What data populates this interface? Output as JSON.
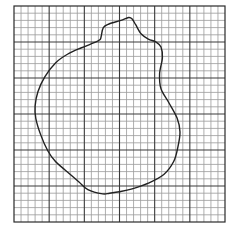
{
  "diagram": {
    "grid": {
      "columns": 30,
      "rows": 30,
      "major_every": 5,
      "minor_color": "#9a9a9a",
      "major_color": "#3a3a3a",
      "border_color": "#2a2a2a"
    },
    "outline": {
      "stroke_color": "#222222",
      "closed": true,
      "points_in_grid_units": [
        [
          12.4,
          4.2
        ],
        [
          12.7,
          3.0
        ],
        [
          13.5,
          2.5
        ],
        [
          15.2,
          2.0
        ],
        [
          16.3,
          1.6
        ],
        [
          16.8,
          1.8
        ],
        [
          17.3,
          2.6
        ],
        [
          18.1,
          3.9
        ],
        [
          19.1,
          4.6
        ],
        [
          20.2,
          5.0
        ],
        [
          20.9,
          5.7
        ],
        [
          21.1,
          7.2
        ],
        [
          20.7,
          9.4
        ],
        [
          20.9,
          11.5
        ],
        [
          22.0,
          13.4
        ],
        [
          23.2,
          15.6
        ],
        [
          23.6,
          17.5
        ],
        [
          23.3,
          19.6
        ],
        [
          22.7,
          21.6
        ],
        [
          21.3,
          23.4
        ],
        [
          19.1,
          24.6
        ],
        [
          16.8,
          25.4
        ],
        [
          15.0,
          25.8
        ],
        [
          13.6,
          26.0
        ],
        [
          12.6,
          26.1
        ],
        [
          10.5,
          25.5
        ],
        [
          9.2,
          24.4
        ],
        [
          7.3,
          22.8
        ],
        [
          5.9,
          21.6
        ],
        [
          4.8,
          20.1
        ],
        [
          3.8,
          17.9
        ],
        [
          3.1,
          15.6
        ],
        [
          3.0,
          13.9
        ],
        [
          3.4,
          11.9
        ],
        [
          4.4,
          9.8
        ],
        [
          5.9,
          7.9
        ],
        [
          7.6,
          6.7
        ],
        [
          9.6,
          5.8
        ],
        [
          11.4,
          5.1
        ],
        [
          12.2,
          4.7
        ]
      ]
    }
  }
}
